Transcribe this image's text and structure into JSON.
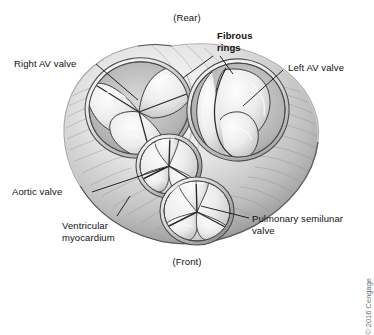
{
  "figure": {
    "title_rear": "(Rear)",
    "title_front": "(Front)",
    "copyright": "© 2016 Cengage",
    "background_color": "#ffffff",
    "ink_color": "#111111"
  },
  "labels": {
    "rear": "(Rear)",
    "front": "(Front)",
    "fibrous_rings": "Fibrous\nrings",
    "right_av_valve": "Right AV valve",
    "left_av_valve": "Left AV valve",
    "aortic_valve": "Aortic valve",
    "ventricular_myocardium": "Ventricular\nmyocardium",
    "pulmonary_semilunar_valve": "Pulmonary semilunar\nvalve"
  },
  "structures": [
    {
      "name": "right-av-valve",
      "cusps": 3,
      "description": "Right atrioventricular (tricuspid) valve"
    },
    {
      "name": "left-av-valve",
      "cusps": 2,
      "description": "Left atrioventricular (bicuspid/mitral) valve"
    },
    {
      "name": "aortic-valve",
      "cusps": 3,
      "description": "Aortic semilunar valve"
    },
    {
      "name": "pulmonary-semilunar-valve",
      "cusps": 3,
      "description": "Pulmonary semilunar valve"
    },
    {
      "name": "fibrous-rings",
      "description": "Fibrous skeleton rings surrounding the valves"
    },
    {
      "name": "ventricular-myocardium",
      "description": "Ventricular muscle mass forming the outer rim"
    }
  ],
  "palette": {
    "myocardium_light": "#f2f2f2",
    "myocardium_mid": "#c9c9c9",
    "myocardium_dark": "#8a8a8a",
    "myocardium_shadow": "#5d5d5d",
    "cusp_light": "#fbfbfb",
    "cusp_mid": "#dcdcdc",
    "outline": "#3a3a3a"
  }
}
